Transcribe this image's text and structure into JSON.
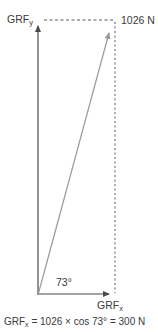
{
  "figure": {
    "colors": {
      "axis": "#4a4a4a",
      "vector": "#9a9a9a",
      "dashed": "#5a5a5a",
      "text": "#3a3a3a",
      "background": "#ffffff"
    },
    "labels": {
      "grf_y": {
        "base": "GRF",
        "sub": "y"
      },
      "grf_x": {
        "base": "GRF",
        "sub": "x"
      },
      "resultant_magnitude": "1026 N",
      "angle": "73°"
    },
    "caption": {
      "base": "GRF",
      "sub": "x",
      "equation": " = 1026 × cos 73° = 300 N"
    }
  }
}
